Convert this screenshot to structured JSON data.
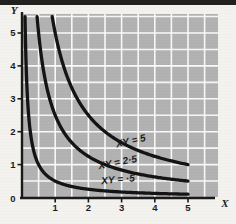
{
  "chart_data": {
    "type": "line",
    "title": "",
    "subtitle": "",
    "xlabel": "X",
    "ylabel": "Y",
    "xlim": [
      0,
      5.9
    ],
    "ylim": [
      0,
      5.5
    ],
    "xticks": [
      "0",
      "1",
      "2",
      "3",
      "4",
      "5"
    ],
    "xtick_values": [
      0,
      1,
      2,
      3,
      4,
      5
    ],
    "yticks": [
      "0",
      "1",
      "2",
      "3",
      "4",
      "5"
    ],
    "ytick_values": [
      0,
      1,
      2,
      3,
      4,
      5
    ],
    "grid": true,
    "grid_step": 0.5,
    "grid_color": "#ffffff",
    "plot_background": "#b2b2b2",
    "legend_position": "inline-annotations",
    "series": [
      {
        "name": "XY = 5",
        "constant": 5,
        "label": "XY = 5",
        "color": "#141414",
        "points": [
          {
            "x": 1.0,
            "y": 5.0
          },
          {
            "x": 1.25,
            "y": 4.0
          },
          {
            "x": 1.667,
            "y": 3.0
          },
          {
            "x": 2.5,
            "y": 2.0
          },
          {
            "x": 3.333,
            "y": 1.5
          },
          {
            "x": 5.0,
            "y": 1.0
          }
        ]
      },
      {
        "name": "XY = 2.5",
        "constant": 2.5,
        "label": "XY = 2·5",
        "color": "#141414",
        "points": [
          {
            "x": 0.5,
            "y": 5.0
          },
          {
            "x": 0.625,
            "y": 4.0
          },
          {
            "x": 0.833,
            "y": 3.0
          },
          {
            "x": 1.25,
            "y": 2.0
          },
          {
            "x": 2.5,
            "y": 1.0
          },
          {
            "x": 5.0,
            "y": 0.5
          }
        ]
      },
      {
        "name": "XY = 0.5",
        "constant": 0.5,
        "label": "XY = ·5",
        "color": "#141414",
        "points": [
          {
            "x": 0.1,
            "y": 5.0
          },
          {
            "x": 0.125,
            "y": 4.0
          },
          {
            "x": 0.167,
            "y": 3.0
          },
          {
            "x": 0.25,
            "y": 2.0
          },
          {
            "x": 0.5,
            "y": 1.0
          },
          {
            "x": 5.0,
            "y": 0.1
          }
        ]
      }
    ],
    "annotations": [
      {
        "text": "XY = 5",
        "x": 3.3,
        "y": 1.62,
        "rotation": -13
      },
      {
        "text": "XY = 2·5",
        "x": 2.9,
        "y": 0.97,
        "rotation": -11
      },
      {
        "text": "XY = ·5",
        "x": 2.9,
        "y": 0.45,
        "rotation": -5
      }
    ]
  },
  "axes": {
    "x_name": "X",
    "y_name": "Y"
  }
}
